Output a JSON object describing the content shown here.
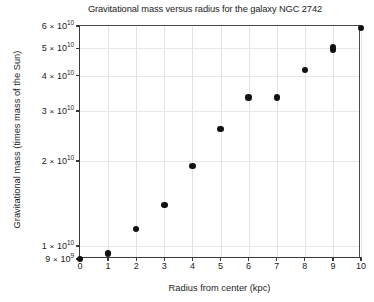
{
  "chart_data": {
    "type": "scatter",
    "title": "Gravitational mass versus radius for the galaxy NGC 2742",
    "xlabel": "Radius from center (kpc)",
    "ylabel": "Gravitational mass (times mass of the Sun)",
    "xscale": "linear",
    "yscale": "log",
    "xlim": [
      0,
      10
    ],
    "ylim": [
      9000000000,
      60000000000
    ],
    "grid": true,
    "legend": null,
    "marker": "filled-circle",
    "marker_color": "#111111",
    "xticks": [
      0,
      1,
      2,
      3,
      4,
      5,
      6,
      7,
      8,
      9,
      10
    ],
    "xtick_labels": [
      "0",
      "1",
      "2",
      "3",
      "4",
      "5",
      "6",
      "7",
      "8",
      "9",
      "10"
    ],
    "yticks": [
      9000000000,
      10000000000,
      20000000000,
      30000000000,
      40000000000,
      50000000000,
      60000000000
    ],
    "ytick_labels": [
      {
        "mantissa": "9",
        "times": "×",
        "base": "10",
        "exponent": "9"
      },
      {
        "mantissa": "1",
        "times": "×",
        "base": "10",
        "exponent": "10"
      },
      {
        "mantissa": "2",
        "times": "×",
        "base": "10",
        "exponent": "10"
      },
      {
        "mantissa": "3",
        "times": "×",
        "base": "10",
        "exponent": "10"
      },
      {
        "mantissa": "4",
        "times": "×",
        "base": "10",
        "exponent": "10"
      },
      {
        "mantissa": "5",
        "times": "×",
        "base": "10",
        "exponent": "10"
      },
      {
        "mantissa": "6",
        "times": "×",
        "base": "10",
        "exponent": "10"
      }
    ],
    "x": [
      0,
      1,
      2,
      3,
      4,
      5,
      6,
      7,
      8,
      9,
      9,
      10
    ],
    "y": [
      9000000000,
      9400000000,
      11500000000,
      14000000000,
      19200000000,
      26000000000,
      33500000000,
      33500000000,
      42000000000,
      49500000000,
      50500000000,
      59000000000
    ],
    "points": [
      {
        "x": 0,
        "y": 9000000000,
        "label": "9.0 × 10⁹"
      },
      {
        "x": 1,
        "y": 9400000000,
        "label": "9.4 × 10⁹"
      },
      {
        "x": 2,
        "y": 11500000000,
        "label": "1.15 × 10¹⁰"
      },
      {
        "x": 3,
        "y": 14000000000,
        "label": "1.4 × 10¹⁰"
      },
      {
        "x": 4,
        "y": 19200000000,
        "label": "1.92 × 10¹⁰"
      },
      {
        "x": 5,
        "y": 26000000000,
        "label": "2.6 × 10¹⁰"
      },
      {
        "x": 6,
        "y": 33500000000,
        "label": "3.35 × 10¹⁰"
      },
      {
        "x": 7,
        "y": 33500000000,
        "label": "3.35 × 10¹⁰"
      },
      {
        "x": 8,
        "y": 42000000000,
        "label": "4.2 × 10¹⁰"
      },
      {
        "x": 9,
        "y": 49500000000,
        "label": "4.95 × 10¹⁰"
      },
      {
        "x": 9,
        "y": 50500000000,
        "label": "5.05 × 10¹⁰"
      },
      {
        "x": 10,
        "y": 59000000000,
        "label": "5.9 × 10¹⁰"
      }
    ]
  }
}
